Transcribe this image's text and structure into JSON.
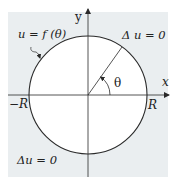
{
  "figure": {
    "type": "polar-dirichlet-problem-diagram",
    "colors": {
      "exterior_fill": "#eaeef0",
      "disk_fill": "#ffffff",
      "stroke": "#2a2a2a",
      "text": "#222222"
    },
    "axes": {
      "x_label": "x",
      "y_label": "y"
    },
    "circle": {
      "left_label": "−R",
      "right_label": "R"
    },
    "boundary_label": "u = f (θ)",
    "angle_label": "θ",
    "region_labels": {
      "interior": "Δ  u = 0",
      "exterior": "Δu = 0"
    }
  }
}
